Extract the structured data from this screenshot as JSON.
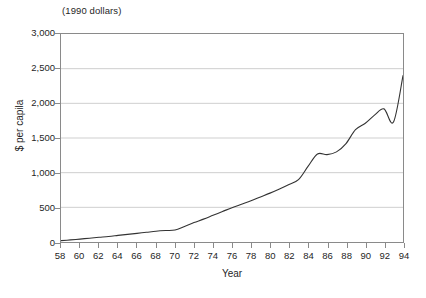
{
  "chart_data": {
    "type": "line",
    "title": "",
    "unit_caption": "(1990 dollars)",
    "xlabel": "Year",
    "ylabel": "$ per capila",
    "xlim": [
      58,
      94
    ],
    "ylim": [
      0,
      3000
    ],
    "grid": true,
    "grid_axis": "y",
    "legend": "none",
    "x_tick_labels": [
      "58",
      "60",
      "62",
      "64",
      "66",
      "68",
      "70",
      "72",
      "74",
      "76",
      "78",
      "80",
      "82",
      "84",
      "86",
      "88",
      "90",
      "92",
      "94"
    ],
    "x_tick_values": [
      58,
      60,
      62,
      64,
      66,
      68,
      70,
      72,
      74,
      76,
      78,
      80,
      82,
      84,
      86,
      88,
      90,
      92,
      94
    ],
    "y_tick_labels": [
      "0",
      "500",
      "1,000",
      "1,500",
      "2,000",
      "2,500",
      "3,000"
    ],
    "y_tick_values": [
      0,
      500,
      1000,
      1500,
      2000,
      2500,
      3000
    ],
    "series": [
      {
        "name": "$ per capita",
        "color": "#333333",
        "x": [
          58,
          59,
          60,
          61,
          62,
          63,
          64,
          65,
          66,
          67,
          68,
          69,
          70,
          71,
          72,
          73,
          74,
          75,
          76,
          77,
          78,
          79,
          80,
          81,
          82,
          83,
          84,
          85,
          86,
          87,
          88,
          89,
          90,
          91,
          92,
          93,
          94
        ],
        "values": [
          20,
          30,
          42,
          55,
          68,
          80,
          95,
          110,
          125,
          140,
          155,
          165,
          172,
          225,
          280,
          330,
          385,
          440,
          495,
          545,
          595,
          650,
          705,
          765,
          830,
          900,
          1090,
          1270,
          1260,
          1300,
          1420,
          1620,
          1710,
          1830,
          1920,
          1730,
          2400
        ]
      }
    ],
    "annotations": []
  },
  "axes": {
    "unit_caption": "(1990 dollars)",
    "y_title": "$ per capila",
    "x_title": "Year"
  }
}
